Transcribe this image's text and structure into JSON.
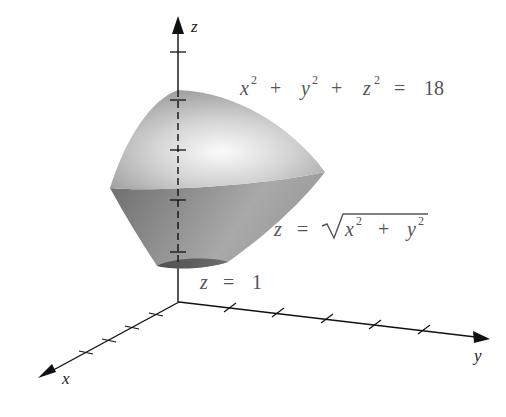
{
  "figure": {
    "axes": {
      "z_label": "z",
      "x_label": "x",
      "y_label": "y",
      "z_ticks": 5,
      "x_ticks": 4,
      "y_ticks": 5
    },
    "labels": {
      "sphere": {
        "x": "x",
        "y": "y",
        "z": "z",
        "exp": "2",
        "plus": "+",
        "eq": "=",
        "value": "18"
      },
      "cone": {
        "lhs": "z",
        "eq": "=",
        "x": "x",
        "y": "y",
        "exp": "2",
        "plus": "+",
        "radical": "√"
      },
      "plane": {
        "lhs": "z",
        "eq": "=",
        "value": "1"
      }
    },
    "colors": {
      "axis": "#111111",
      "sphere_light": "#f4f4f4",
      "sphere_dark": "#9a9a9a",
      "cone_light": "#a8a8a8",
      "cone_dark": "#6a6a6a",
      "base": "#5a5a5a",
      "label": "#555555"
    }
  }
}
